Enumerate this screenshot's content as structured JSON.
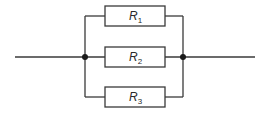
{
  "diagram": {
    "type": "parallel-resistor-circuit",
    "colors": {
      "wire": "#3a3a3a",
      "junction": "#1a1a1a",
      "background": "#ffffff"
    },
    "resistors": [
      {
        "symbol": "R",
        "subscript": "1"
      },
      {
        "symbol": "R",
        "subscript": "2"
      },
      {
        "symbol": "R",
        "subscript": "3"
      }
    ]
  }
}
